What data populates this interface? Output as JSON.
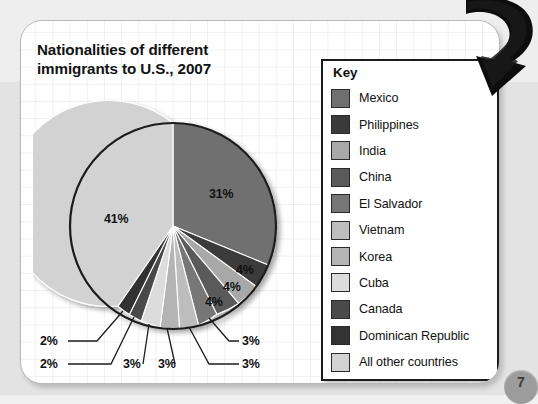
{
  "page": {
    "background_color": "#eeeeee",
    "card_color": "#ffffff",
    "page_number": "7"
  },
  "title": {
    "line1": "Nationalities of different",
    "line2": "immigrants to U.S., 2007"
  },
  "key": {
    "heading": "Key",
    "items": [
      {
        "label": "Mexico",
        "color": "#6f6f6f"
      },
      {
        "label": "Philippines",
        "color": "#3a3a3a"
      },
      {
        "label": "India",
        "color": "#a8a8a8"
      },
      {
        "label": "China",
        "color": "#5a5a5a"
      },
      {
        "label": "El Salvador",
        "color": "#777777"
      },
      {
        "label": "Vietnam",
        "color": "#bdbdbd"
      },
      {
        "label": "Korea",
        "color": "#b4b4b4"
      },
      {
        "label": "Cuba",
        "color": "#dcdcdc"
      },
      {
        "label": "Canada",
        "color": "#4a4a4a"
      },
      {
        "label": "Dominican Republic",
        "color": "#333333"
      },
      {
        "label": "All other countries",
        "color": "#d2d2d2"
      }
    ]
  },
  "chart_data": {
    "type": "pie",
    "title": "Nationalities of different immigrants to U.S., 2007",
    "legend_position": "right",
    "grid": false,
    "start_angle_deg": 0,
    "direction": "clockwise",
    "categories": [
      "Mexico",
      "Philippines",
      "India",
      "China",
      "El Salvador",
      "Vietnam",
      "Korea",
      "Cuba",
      "Canada",
      "Dominican Republic",
      "All other countries"
    ],
    "values": [
      31,
      4,
      4,
      4,
      3,
      3,
      3,
      3,
      2,
      2,
      41
    ],
    "labels": [
      "31%",
      "4%",
      "4%",
      "4%",
      "3%",
      "3%",
      "3%",
      "3%",
      "2%",
      "2%",
      "41%"
    ],
    "colors": [
      "#6f6f6f",
      "#3a3a3a",
      "#a8a8a8",
      "#5a5a5a",
      "#777777",
      "#bdbdbd",
      "#b4b4b4",
      "#dcdcdc",
      "#4a4a4a",
      "#333333",
      "#d2d2d2"
    ],
    "units": "percent"
  },
  "pie_labels": {
    "mexico": "31%",
    "other": "41%",
    "philippines": "4%",
    "india": "4%",
    "china": "4%",
    "el_salvador": "3%",
    "vietnam": "3%",
    "korea": "3%",
    "cuba": "3%",
    "canada": "2%",
    "dominican_republic": "2%"
  }
}
